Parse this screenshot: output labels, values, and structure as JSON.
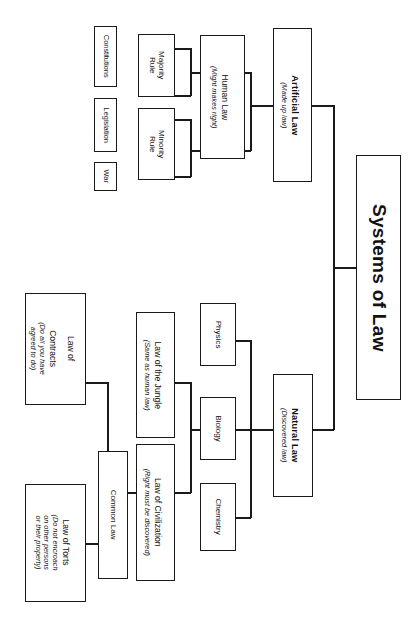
{
  "diagram": {
    "type": "tree",
    "orientation": "rotated-90-clockwise",
    "root": {
      "label": "Systems of Law"
    },
    "branches": [
      {
        "id": "artificial-law",
        "title": "Artificial Law",
        "subtitle": "(Made up law)",
        "children": [
          {
            "id": "human-law",
            "title": "Human Law",
            "subtitle": "(Might makes right)",
            "children": [
              {
                "id": "majority-rule",
                "title": "Majority Rule",
                "children": [
                  {
                    "id": "constitutions",
                    "title": "Constitutions"
                  },
                  {
                    "id": "legislation",
                    "title": "Legislation"
                  }
                ]
              },
              {
                "id": "minority-rule",
                "title": "Minority Rule",
                "children": [
                  {
                    "id": "legislation-2",
                    "title": "Legislation"
                  },
                  {
                    "id": "war",
                    "title": "War"
                  }
                ]
              }
            ]
          }
        ]
      },
      {
        "id": "natural-law",
        "title": "Natural Law",
        "subtitle": "(Discovered law)",
        "children": [
          {
            "id": "physics",
            "title": "Physics"
          },
          {
            "id": "biology",
            "title": "Biology",
            "children": [
              {
                "id": "law-of-the-jungle",
                "title": "Law of the Jungle",
                "subtitle": "(Same as human law)"
              },
              {
                "id": "law-of-civilization",
                "title": "Law of Civilization",
                "subtitle": "(Right must be discovered)",
                "children": [
                  {
                    "id": "common-law",
                    "title": "Common Law",
                    "children": [
                      {
                        "id": "law-of-contracts",
                        "title": "Law of Contracts",
                        "subtitle": "(Do all you have agreed to do)"
                      },
                      {
                        "id": "law-of-torts",
                        "title": "Law of Torts",
                        "subtitle": "(Do not encroach on other persons or their property)"
                      }
                    ]
                  }
                ]
              }
            ]
          },
          {
            "id": "chemistry",
            "title": "Chemistry"
          }
        ]
      }
    ]
  },
  "nodes": {
    "root": {
      "label": "Systems of Law"
    },
    "artificial_law": {
      "title": "Artificial Law",
      "subtitle": "(Made up law)"
    },
    "human_law": {
      "title": "Human Law",
      "subtitle": "(Might makes right)"
    },
    "majority_rule": {
      "title": "Majority Rule"
    },
    "minority_rule": {
      "title": "Minority Rule"
    },
    "constitutions": {
      "title": "Constitutions"
    },
    "legislation": {
      "title": "Legislation"
    },
    "war": {
      "title": "War"
    },
    "natural_law": {
      "title": "Natural Law",
      "subtitle": "(Discovered law)"
    },
    "physics": {
      "title": "Physics"
    },
    "biology": {
      "title": "Biology"
    },
    "chemistry": {
      "title": "Chemistry"
    },
    "law_of_the_jungle": {
      "title": "Law of the Jungle",
      "subtitle": "(Same as human law)"
    },
    "law_of_civilization": {
      "title": "Law of Civilization",
      "subtitle": "(Right must be discovered)"
    },
    "common_law": {
      "title": "Common Law"
    },
    "law_of_contracts": {
      "title": "Law of Contracts",
      "subtitle": "(Do all you have agreed to do)"
    },
    "law_of_torts": {
      "title": "Law of Torts",
      "subtitle": "(Do not encroach on other persons or their property)"
    }
  },
  "colors": {
    "background": "#ffffff",
    "box_border": "#1a1a1a",
    "connector": "#1a1a1a",
    "text": "#121212"
  }
}
